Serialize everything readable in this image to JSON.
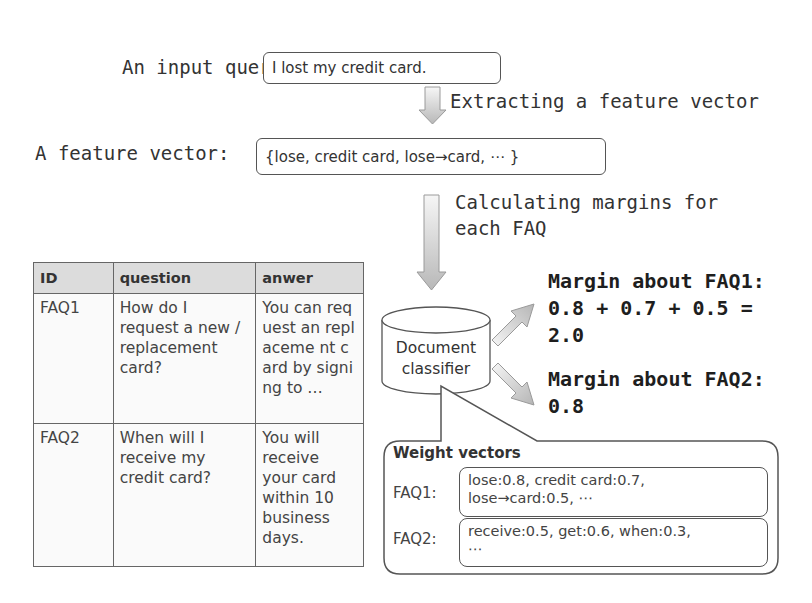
{
  "input_query": {
    "label": "An input query:",
    "value": "I lost my credit card."
  },
  "step_extract": {
    "label": "Extracting a feature vector"
  },
  "feature_vector": {
    "label": "A feature vector:",
    "value": "{lose, credit card, lose→card, ⋯ }"
  },
  "step_margins": {
    "line1": "Calculating margins for",
    "line2": "each FAQ"
  },
  "faq_table": {
    "headers": [
      "ID",
      "question",
      "anwer"
    ],
    "rows": [
      {
        "id": "FAQ1",
        "question": "How do I request a new / replacement card?",
        "answer": "You can request an replaceme nt card by signing to …"
      },
      {
        "id": "FAQ2",
        "question": "When will I receive my credit card?",
        "answer": "You will receive your card within 10 business days."
      }
    ]
  },
  "classifier": {
    "line1": "Document",
    "line2": "classifier"
  },
  "margins": [
    {
      "line1": "Margin about FAQ1:",
      "line2": "0.8 + 0.7 + 0.5 =",
      "line3": "2.0"
    },
    {
      "line1": "Margin about FAQ2:",
      "line2": "0.8"
    }
  ],
  "weight_vectors": {
    "title": "Weight vectors",
    "items": [
      {
        "label": "FAQ1:",
        "line1": "lose:0.8, credit card:0.7,",
        "line2": "lose→card:0.5, ⋯"
      },
      {
        "label": "FAQ2:",
        "line1": "receive:0.5, get:0.6, when:0.3,",
        "line2": "⋯"
      }
    ]
  },
  "colors": {
    "arrow_fill_top": "#f4f4f4",
    "arrow_fill_bottom": "#bdbdbd",
    "table_header": "#dcdcdc",
    "outline": "#555555"
  }
}
